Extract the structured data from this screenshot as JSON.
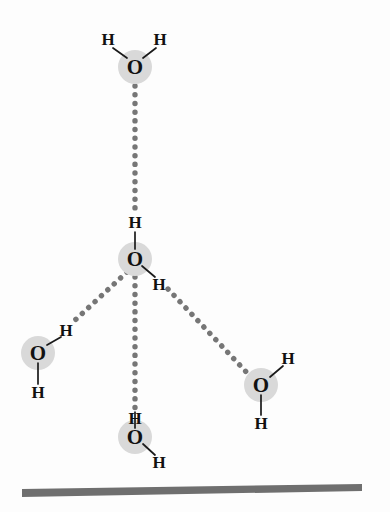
{
  "figure": {
    "type": "molecular-diagram",
    "background_color": "#fdfdfd"
  },
  "style": {
    "oxygen_halo_color": "#d9d9d9",
    "oxygen_halo_radius": 17,
    "atom_text_color": "#111111",
    "covalent_bond_color": "#1a1a1a",
    "hydrogen_bond_color": "#767676",
    "surface_color": "#6f6f6f"
  },
  "labels": {
    "oxygen": "O",
    "hydrogen": "H"
  },
  "molecules": [
    {
      "id": "water-top",
      "name": "top-water-molecule",
      "oxygen": {
        "label": "O",
        "x": 135,
        "y": 67
      },
      "hydrogens": [
        {
          "label": "H",
          "x": 108,
          "y": 39,
          "role": "free"
        },
        {
          "label": "H",
          "x": 160,
          "y": 39,
          "role": "free"
        }
      ]
    },
    {
      "id": "water-center",
      "name": "central-water-molecule",
      "oxygen": {
        "label": "O",
        "x": 135,
        "y": 259
      },
      "hydrogens": [
        {
          "label": "H",
          "x": 135,
          "y": 222,
          "role": "donor-up"
        },
        {
          "label": "H",
          "x": 159,
          "y": 284,
          "role": "donor-down-right"
        }
      ]
    },
    {
      "id": "water-left",
      "name": "left-water-molecule",
      "oxygen": {
        "label": "O",
        "x": 38,
        "y": 353
      },
      "hydrogens": [
        {
          "label": "H",
          "x": 66,
          "y": 330,
          "role": "acceptor-side"
        },
        {
          "label": "H",
          "x": 38,
          "y": 392,
          "role": "free"
        }
      ]
    },
    {
      "id": "water-bottom",
      "name": "bottom-water-molecule",
      "oxygen": {
        "label": "O",
        "x": 135,
        "y": 437
      },
      "hydrogens": [
        {
          "label": "H",
          "x": 135,
          "y": 418,
          "role": "acceptor-up"
        },
        {
          "label": "H",
          "x": 159,
          "y": 462,
          "role": "free"
        }
      ]
    },
    {
      "id": "water-right",
      "name": "right-water-molecule",
      "oxygen": {
        "label": "O",
        "x": 261,
        "y": 385
      },
      "hydrogens": [
        {
          "label": "H",
          "x": 288,
          "y": 358,
          "role": "acceptor-side"
        },
        {
          "label": "H",
          "x": 261,
          "y": 423,
          "role": "free"
        }
      ]
    }
  ],
  "covalent_bonds": [
    {
      "name": "top-o-h-left",
      "x1": 113,
      "y1": 48,
      "x2": 127,
      "y2": 58
    },
    {
      "name": "top-o-h-right",
      "x1": 156,
      "y1": 48,
      "x2": 143,
      "y2": 58
    },
    {
      "name": "center-o-h-up",
      "x1": 135,
      "y1": 232,
      "x2": 135,
      "y2": 249
    },
    {
      "name": "center-o-h-dr",
      "x1": 142,
      "y1": 266,
      "x2": 155,
      "y2": 277
    },
    {
      "name": "left-o-h-ur",
      "x1": 47,
      "y1": 345,
      "x2": 61,
      "y2": 337
    },
    {
      "name": "left-o-h-down",
      "x1": 38,
      "y1": 363,
      "x2": 38,
      "y2": 384
    },
    {
      "name": "bottom-o-h-up",
      "x1": 135,
      "y1": 428,
      "x2": 135,
      "y2": 412
    },
    {
      "name": "bottom-o-h-dr",
      "x1": 143,
      "y1": 444,
      "x2": 155,
      "y2": 455
    },
    {
      "name": "right-o-h-ur",
      "x1": 270,
      "y1": 377,
      "x2": 283,
      "y2": 366
    },
    {
      "name": "right-o-h-down",
      "x1": 261,
      "y1": 395,
      "x2": 261,
      "y2": 415
    }
  ],
  "hydrogen_bonds": [
    {
      "name": "hbond-top-to-center",
      "from": "water-top",
      "to": "water-center",
      "x1": 135,
      "y1": 86,
      "x2": 135,
      "y2": 214
    },
    {
      "name": "hbond-center-to-left",
      "from": "water-center",
      "to": "water-left",
      "x1": 127,
      "y1": 272,
      "x2": 73,
      "y2": 322
    },
    {
      "name": "hbond-center-to-bottom",
      "from": "water-center",
      "to": "water-bottom",
      "x1": 135,
      "y1": 277,
      "x2": 135,
      "y2": 408
    },
    {
      "name": "hbond-center-to-right",
      "from": "water-center",
      "to": "water-right",
      "x1": 168,
      "y1": 289,
      "x2": 251,
      "y2": 377
    }
  ],
  "surface": {
    "name": "substrate-surface-bar",
    "points": "22,489 362,484 362,491 22,497",
    "color": "#6f6f6f"
  }
}
